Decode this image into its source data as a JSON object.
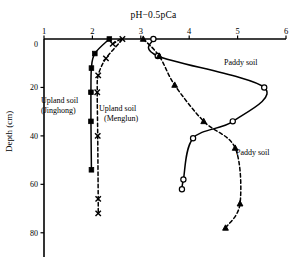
{
  "chart_data": {
    "type": "line",
    "title": "pH−0.5pCa",
    "xlabel": "pH−0.5pCa",
    "ylabel": "Depth (cm)",
    "xlim": [
      1,
      6
    ],
    "ylim": [
      0,
      90
    ],
    "y_inverted": true,
    "grid": false,
    "legend_position": "inline-annotations",
    "xticks": [
      "1",
      "2",
      "3",
      "4",
      "5",
      "6"
    ],
    "xtick_values": [
      1,
      2,
      3,
      4,
      5,
      6
    ],
    "yticks": [
      "0",
      "20",
      "40",
      "60",
      "80"
    ],
    "ytick_values": [
      0,
      20,
      40,
      60,
      80
    ],
    "series": [
      {
        "name": "Upland soil (Jinghong)",
        "marker": "filled-square",
        "line": "solid",
        "color": "#000000",
        "x": [
          2.35,
          2.05,
          1.98,
          1.97,
          1.97,
          1.98
        ],
        "y": [
          0,
          6,
          12,
          22,
          34,
          54
        ]
      },
      {
        "name": "Upland soil (Menglun)",
        "marker": "cross-x",
        "line": "dashed",
        "color": "#000000",
        "x": [
          2.42,
          2.62,
          2.28,
          2.12,
          2.1,
          2.11,
          2.12,
          2.12
        ],
        "y": [
          2,
          0,
          8,
          15,
          22,
          40,
          66,
          72
        ]
      },
      {
        "name": "Paddy soil",
        "marker": "open-circle",
        "line": "solid",
        "color": "#000000",
        "x": [
          3.26,
          3.35,
          5.55,
          4.9,
          4.08,
          3.88,
          3.85
        ],
        "y": [
          0,
          7,
          20,
          34,
          41,
          58,
          62
        ]
      },
      {
        "name": "Paddy soil",
        "marker": "open-triangle",
        "line": "dashed",
        "color": "#000000",
        "x": [
          3.05,
          3.38,
          3.7,
          4.3,
          4.95,
          5.05,
          4.75
        ],
        "y": [
          0,
          7,
          19,
          34,
          45,
          68,
          78
        ]
      }
    ],
    "annotations": [
      {
        "text": "Upland soil",
        "sub": "(Jinghong)",
        "x": 1.22,
        "y": 19
      },
      {
        "text": "Upland soil",
        "sub": "(Menglun)",
        "x": 2.28,
        "y": 27
      },
      {
        "text": "Paddy soil",
        "x": 4.72,
        "y": 8
      },
      {
        "text": "Paddy soil",
        "x": 5.05,
        "y": 40
      }
    ]
  },
  "labels": {
    "title": "pH−0.5pCa",
    "ylabel": "Depth (cm)",
    "upland_jinghong_1": "Upland soil",
    "upland_jinghong_2": "(Jinghong)",
    "upland_menglun_1": "Upland soil",
    "upland_menglun_2": "(Menglun)",
    "paddy_top": "Paddy soil",
    "paddy_bottom": "Paddy soil"
  }
}
